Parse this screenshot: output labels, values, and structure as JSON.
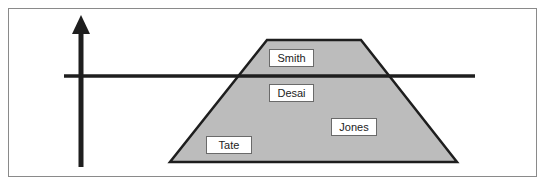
{
  "diagram": {
    "colors": {
      "frame_border": "#8a8a8a",
      "trapezoid_fill": "#bcbcbc",
      "stroke": "#1e1e1e",
      "label_bg": "#ffffff"
    },
    "axis": {
      "type": "vertical-arrow-up"
    },
    "threshold_line": {
      "type": "horizontal-line"
    },
    "shape": {
      "type": "trapezoid"
    },
    "labels": [
      {
        "id": "smith",
        "text": "Smith"
      },
      {
        "id": "desai",
        "text": "Desai"
      },
      {
        "id": "jones",
        "text": "Jones"
      },
      {
        "id": "tate",
        "text": "Tate"
      }
    ]
  }
}
